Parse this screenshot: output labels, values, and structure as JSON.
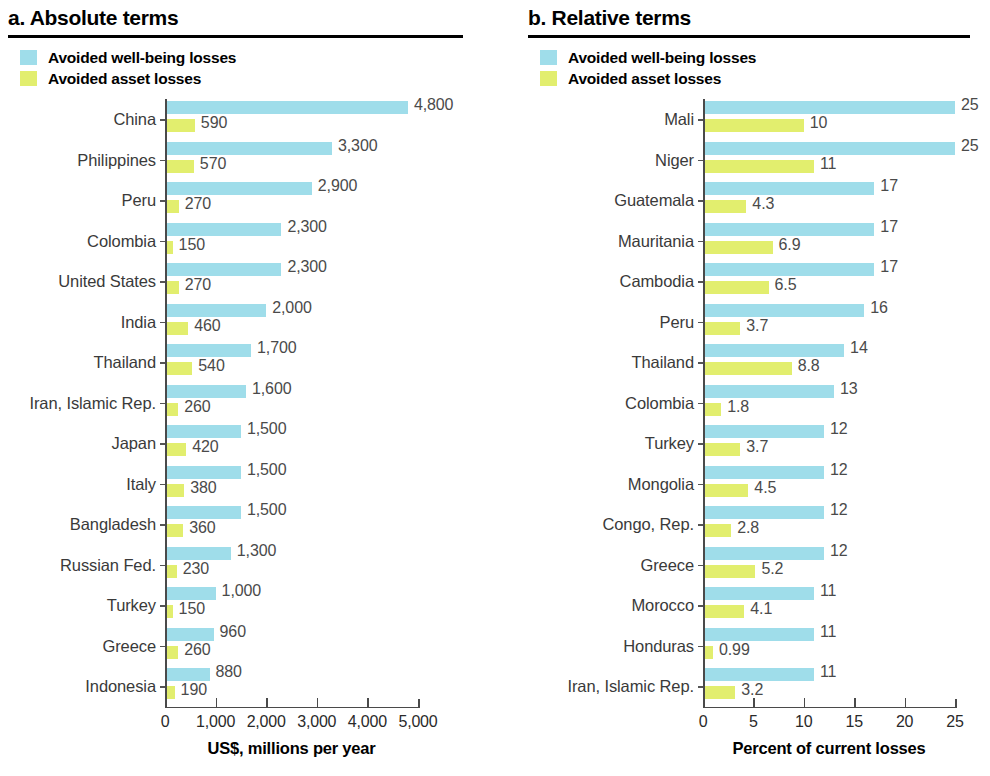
{
  "figure": {
    "legend": {
      "wellbeing_label": "Avoided well-being losses",
      "asset_label": "Avoided asset losses",
      "wellbeing_color": "#9FDDEA",
      "asset_color": "#E2EE6E"
    }
  },
  "panel_a": {
    "title": "a. Absolute terms"
  },
  "panel_b": {
    "title": "b. Relative terms"
  },
  "chart_data": [
    {
      "type": "bar",
      "title": "a. Absolute terms",
      "orientation": "horizontal",
      "grouped": true,
      "xlabel": "US$, millions per year",
      "ylabel": "",
      "xlim": [
        0,
        5000
      ],
      "xticks": [
        0,
        1000,
        2000,
        3000,
        4000,
        5000
      ],
      "xtick_labels": [
        "0",
        "1,000",
        "2,000",
        "3,000",
        "4,000",
        "5,000"
      ],
      "grid": false,
      "legend_position": "top-left",
      "categories": [
        "China",
        "Philippines",
        "Peru",
        "Colombia",
        "United States",
        "India",
        "Thailand",
        "Iran, Islamic Rep.",
        "Japan",
        "Italy",
        "Bangladesh",
        "Russian Fed.",
        "Turkey",
        "Greece",
        "Indonesia"
      ],
      "series": [
        {
          "name": "Avoided well-being losses",
          "color": "#9FDDEA",
          "values": [
            4800,
            3300,
            2900,
            2300,
            2300,
            2000,
            1700,
            1600,
            1500,
            1500,
            1500,
            1300,
            1000,
            960,
            880
          ],
          "labels": [
            "4,800",
            "3,300",
            "2,900",
            "2,300",
            "2,300",
            "2,000",
            "1,700",
            "1,600",
            "1,500",
            "1,500",
            "1,500",
            "1,300",
            "1,000",
            "960",
            "880"
          ]
        },
        {
          "name": "Avoided asset losses",
          "color": "#E2EE6E",
          "values": [
            590,
            570,
            270,
            150,
            270,
            460,
            540,
            260,
            420,
            380,
            360,
            230,
            150,
            260,
            190
          ],
          "labels": [
            "590",
            "570",
            "270",
            "150",
            "270",
            "460",
            "540",
            "260",
            "420",
            "380",
            "360",
            "230",
            "150",
            "260",
            "190"
          ]
        }
      ]
    },
    {
      "type": "bar",
      "title": "b. Relative terms",
      "orientation": "horizontal",
      "grouped": true,
      "xlabel": "Percent of current losses",
      "ylabel": "",
      "xlim": [
        0,
        25
      ],
      "xticks": [
        0,
        5,
        10,
        15,
        20,
        25
      ],
      "xtick_labels": [
        "0",
        "5",
        "10",
        "15",
        "20",
        "25"
      ],
      "grid": false,
      "legend_position": "top-left",
      "categories": [
        "Mali",
        "Niger",
        "Guatemala",
        "Mauritania",
        "Cambodia",
        "Peru",
        "Thailand",
        "Colombia",
        "Turkey",
        "Mongolia",
        "Congo, Rep.",
        "Greece",
        "Morocco",
        "Honduras",
        "Iran, Islamic Rep."
      ],
      "series": [
        {
          "name": "Avoided well-being losses",
          "color": "#9FDDEA",
          "values": [
            25,
            25,
            17,
            17,
            17,
            16,
            14,
            13,
            12,
            12,
            12,
            12,
            11,
            11,
            11
          ],
          "labels": [
            "25",
            "25",
            "17",
            "17",
            "17",
            "16",
            "14",
            "13",
            "12",
            "12",
            "12",
            "12",
            "11",
            "11",
            "11"
          ]
        },
        {
          "name": "Avoided asset losses",
          "color": "#E2EE6E",
          "values": [
            10,
            11,
            4.3,
            6.9,
            6.5,
            3.7,
            8.8,
            1.8,
            3.7,
            4.5,
            2.8,
            5.2,
            4.1,
            0.99,
            3.2
          ],
          "labels": [
            "10",
            "11",
            "4.3",
            "6.9",
            "6.5",
            "3.7",
            "8.8",
            "1.8",
            "3.7",
            "4.5",
            "2.8",
            "5.2",
            "4.1",
            "0.99",
            "3.2"
          ]
        }
      ]
    }
  ]
}
